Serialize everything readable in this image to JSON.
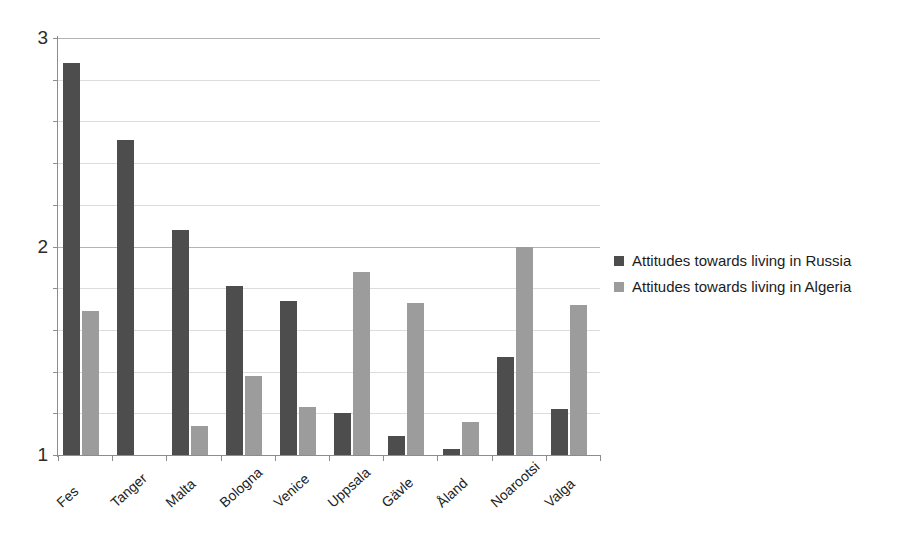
{
  "chart_data": {
    "type": "bar",
    "title": "",
    "subtitle": "",
    "xlabel": "",
    "ylabel": "",
    "ylim": [
      1,
      3
    ],
    "y_major_ticks": [
      1,
      2,
      3
    ],
    "y_major_tick_labels": [
      "1",
      "2",
      "3"
    ],
    "y_minor_step": 0.2,
    "grid": true,
    "legend_position": "right",
    "categories": [
      "Fes",
      "Tanger",
      "Malta",
      "Bologna",
      "Venice",
      "Uppsala",
      "Gävle",
      "Åland",
      "Noarootsi",
      "Valga"
    ],
    "series": [
      {
        "name": "Attitudes towards living in Russia",
        "color": "#4d4d4d",
        "values": [
          2.88,
          2.51,
          2.08,
          1.81,
          1.74,
          1.2,
          1.09,
          1.03,
          1.47,
          1.22
        ]
      },
      {
        "name": "Attitudes towards living in Algeria",
        "color": "#9c9c9c",
        "values": [
          1.69,
          null,
          1.14,
          1.38,
          1.23,
          1.88,
          1.73,
          1.16,
          2.0,
          1.72
        ]
      }
    ]
  },
  "legend": {
    "entries": [
      {
        "label": "Attitudes towards living in Russia"
      },
      {
        "label": "Attitudes towards living in Algeria"
      }
    ]
  }
}
